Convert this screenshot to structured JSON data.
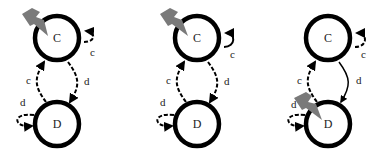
{
  "panels": [
    {
      "id": "panel-1",
      "states": [
        {
          "label": "C",
          "shocked": true
        },
        {
          "label": "D",
          "shocked": false
        }
      ],
      "edges": {
        "c_self": {
          "label": "c",
          "style": "dashed"
        },
        "c_to_d": {
          "label": "d",
          "style": "dashed"
        },
        "d_to_c": {
          "label": "c",
          "style": "dashed"
        },
        "d_self": {
          "label": "d",
          "style": "dashed"
        }
      }
    },
    {
      "id": "panel-2",
      "states": [
        {
          "label": "C",
          "shocked": true
        },
        {
          "label": "D",
          "shocked": false
        }
      ],
      "edges": {
        "c_self": {
          "label": "c",
          "style": "solid"
        },
        "c_to_d": {
          "label": "d",
          "style": "dashed"
        },
        "d_to_c": {
          "label": "c",
          "style": "dashed"
        },
        "d_self": {
          "label": "d",
          "style": "dashed"
        }
      }
    },
    {
      "id": "panel-3",
      "states": [
        {
          "label": "C",
          "shocked": false
        },
        {
          "label": "D",
          "shocked": true
        }
      ],
      "edges": {
        "c_self": {
          "label": "c",
          "style": "dashed"
        },
        "c_to_d": {
          "label": "d",
          "style": "solid"
        },
        "d_to_c": {
          "label": "c",
          "style": "dashed"
        },
        "d_self": {
          "label": "d",
          "style": "dashed"
        }
      }
    }
  ],
  "colors": {
    "stroke": "#000000",
    "shock": "#7a7a7a",
    "background": "#ffffff"
  }
}
